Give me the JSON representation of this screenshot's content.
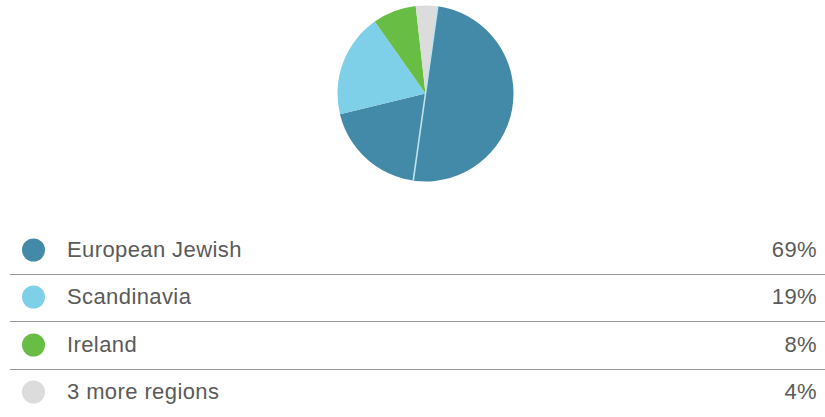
{
  "chart_data": {
    "type": "pie",
    "title": "",
    "subtitle": "",
    "legend_position": "bottom",
    "grid": false,
    "start_angle_deg": 8,
    "direction": "clockwise",
    "categories": [
      "European Jewish",
      "Scandinavia",
      "Ireland",
      "3 more regions"
    ],
    "values": [
      69,
      19,
      8,
      4
    ],
    "value_labels": [
      "69%",
      "19%",
      "8%",
      "4%"
    ],
    "units": "percent",
    "colors": [
      "#4389a8",
      "#7ecfe8",
      "#68bd45",
      "#dcdcdc"
    ],
    "slices": [
      {
        "label": "European Jewish",
        "value": 69,
        "value_label": "69%",
        "color": "#4389a8"
      },
      {
        "label": "Scandinavia",
        "value": 19,
        "value_label": "19%",
        "color": "#7ecfe8"
      },
      {
        "label": "Ireland",
        "value": 8,
        "value_label": "8%",
        "color": "#68bd45"
      },
      {
        "label": "3 more regions",
        "value": 4,
        "value_label": "4%",
        "color": "#dcdcdc"
      }
    ]
  },
  "legend": {
    "rows": [
      {
        "swatch_name": "european-jewish",
        "label": "European Jewish",
        "value": "69%",
        "color": "#4389a8"
      },
      {
        "swatch_name": "scandinavia",
        "label": "Scandinavia",
        "value": "19%",
        "color": "#7ecfe8"
      },
      {
        "swatch_name": "ireland",
        "label": "Ireland",
        "value": "8%",
        "color": "#68bd45"
      },
      {
        "swatch_name": "three-more-regions",
        "label": "3 more regions",
        "value": "4%",
        "color": "#dcdcdc"
      }
    ]
  },
  "theme": {
    "background": "#ffffff",
    "text": "#5a5a5a",
    "rule": "#999999",
    "slice_separator": "#bfe4ef"
  }
}
